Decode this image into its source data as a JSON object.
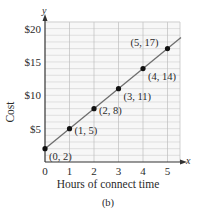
{
  "chart_data": {
    "type": "line",
    "title": "",
    "caption": "(b)",
    "xlabel": "Hours of connect time",
    "ylabel": "Cost",
    "x_axis_var": "x",
    "y_axis_var": "y",
    "xlim": [
      0,
      5.5
    ],
    "ylim": [
      0,
      21
    ],
    "x_ticks": [
      0,
      1,
      2,
      3,
      4,
      5
    ],
    "x_tick_labels": [
      "0",
      "1",
      "2",
      "3",
      "4",
      "5"
    ],
    "y_ticks": [
      5,
      10,
      15,
      20
    ],
    "y_tick_labels": [
      "$5",
      "$10",
      "$15",
      "$20"
    ],
    "grid": true,
    "legend": null,
    "series": [
      {
        "name": "Cost",
        "x": [
          0,
          1,
          2,
          3,
          4,
          5
        ],
        "y": [
          2,
          5,
          8,
          11,
          14,
          17
        ],
        "point_labels": [
          "(0, 2)",
          "(1, 5)",
          "(2, 8)",
          "(3, 11)",
          "(4, 14)",
          "(5, 17)"
        ],
        "line_color": "#6e6e6e",
        "marker_color": "#111111"
      }
    ]
  }
}
